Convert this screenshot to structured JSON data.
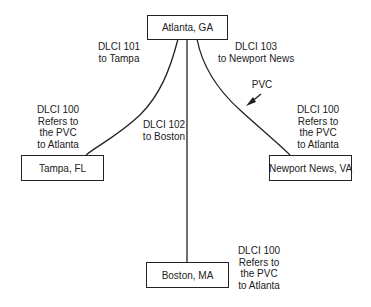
{
  "nodes": {
    "atlanta": {
      "label": "Atlanta, GA"
    },
    "tampa": {
      "label": "Tampa, FL"
    },
    "newport": {
      "label": "Newport News, VA"
    },
    "boston": {
      "label": "Boston, MA"
    }
  },
  "links": {
    "to_tampa": {
      "lines": [
        "DLCI 101",
        "to Tampa"
      ]
    },
    "to_boston": {
      "lines": [
        "DLCI 102",
        "to Boston"
      ]
    },
    "to_newport": {
      "lines": [
        "DLCI 103",
        "to Newport News"
      ]
    }
  },
  "remote_labels": {
    "tampa": {
      "lines": [
        "DLCI 100",
        "Refers to",
        "the PVC",
        "to Atlanta"
      ]
    },
    "newport": {
      "lines": [
        "DLCI 100",
        "Refers to",
        "the PVC",
        "to Atlanta"
      ]
    },
    "boston": {
      "lines": [
        "DLCI 100",
        "Refers to",
        "the PVC",
        "to Atlanta"
      ]
    }
  },
  "annotations": {
    "pvc": {
      "label": "PVC"
    }
  },
  "colors": {
    "stroke": "#222222",
    "background": "#ffffff"
  }
}
